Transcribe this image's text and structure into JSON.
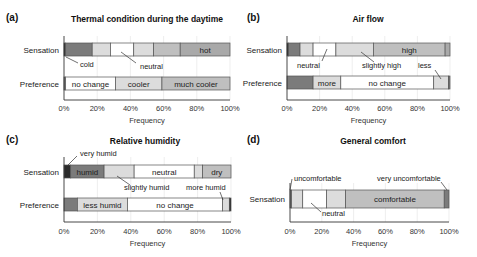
{
  "palette": {
    "black": "#2a2a2a",
    "dark": "#7b7b7b",
    "mid": "#a9a9a9",
    "gray": "#bfbfbf",
    "light": "#dcdcdc",
    "white": "#ffffff",
    "outline": "#555555",
    "grid": "#e6e6e6"
  },
  "chart_data": [
    {
      "panel": "(a)",
      "type": "bar",
      "orientation": "horizontal-stacked",
      "title": "Thermal condition during the daytime",
      "xlabel": "Frequency",
      "xlim": [
        0,
        100
      ],
      "xticks": [
        "0%",
        "20%",
        "40%",
        "60%",
        "80%",
        "100%"
      ],
      "categories": [
        "Sensation",
        "Preference"
      ],
      "rows": [
        {
          "name": "Sensation",
          "segments": [
            {
              "label": "cold",
              "value": 1,
              "color": "black"
            },
            {
              "label": "",
              "value": 16,
              "color": "dark"
            },
            {
              "label": "",
              "value": 11,
              "color": "light"
            },
            {
              "label": "neutral",
              "value": 14,
              "color": "white"
            },
            {
              "label": "",
              "value": 12,
              "color": "light"
            },
            {
              "label": "",
              "value": 16,
              "color": "gray"
            },
            {
              "label": "hot",
              "value": 30,
              "color": "mid"
            }
          ]
        },
        {
          "name": "Preference",
          "segments": [
            {
              "label": "",
              "value": 1,
              "color": "dark"
            },
            {
              "label": "no change",
              "value": 30,
              "color": "white"
            },
            {
              "label": "cooler",
              "value": 28,
              "color": "light"
            },
            {
              "label": "much cooler",
              "value": 41,
              "color": "gray"
            }
          ]
        }
      ],
      "annotations": [
        {
          "text": "cold",
          "row": "Sensation",
          "points_to_pct": 0.5
        },
        {
          "text": "neutral",
          "row": "Sensation",
          "points_to_pct": 35
        }
      ]
    },
    {
      "panel": "(b)",
      "type": "bar",
      "orientation": "horizontal-stacked",
      "title": "Air flow",
      "xlabel": "Frequency",
      "xlim": [
        0,
        100
      ],
      "xticks": [
        "0%",
        "20%",
        "40%",
        "60%",
        "80%",
        "100%"
      ],
      "categories": [
        "Sensation",
        "Preference"
      ],
      "rows": [
        {
          "name": "Sensation",
          "segments": [
            {
              "label": "",
              "value": 1,
              "color": "black"
            },
            {
              "label": "",
              "value": 7,
              "color": "dark"
            },
            {
              "label": "",
              "value": 8,
              "color": "light"
            },
            {
              "label": "neutral",
              "value": 14,
              "color": "white"
            },
            {
              "label": "slightly high",
              "value": 23,
              "color": "light"
            },
            {
              "label": "high",
              "value": 44,
              "color": "gray"
            },
            {
              "label": "",
              "value": 3,
              "color": "mid"
            }
          ]
        },
        {
          "name": "Preference",
          "segments": [
            {
              "label": "",
              "value": 16,
              "color": "dark"
            },
            {
              "label": "more",
              "value": 17,
              "color": "light"
            },
            {
              "label": "no change",
              "value": 57,
              "color": "white"
            },
            {
              "label": "less",
              "value": 9,
              "color": "light"
            },
            {
              "label": "",
              "value": 1,
              "color": "dark"
            }
          ]
        }
      ],
      "annotations": [
        {
          "text": "neutral",
          "row": "Sensation",
          "points_to_pct": 24
        },
        {
          "text": "slightly high",
          "row": "Sensation",
          "points_to_pct": 42
        },
        {
          "text": "less",
          "row": "Preference",
          "points_to_pct": 95
        }
      ]
    },
    {
      "panel": "(c)",
      "type": "bar",
      "orientation": "horizontal-stacked",
      "title": "Relative humidity",
      "xlabel": "Frequency",
      "xlim": [
        0,
        100
      ],
      "xticks": [
        "0%",
        "20%",
        "40%",
        "60%",
        "80%",
        "100%"
      ],
      "categories": [
        "Sensation",
        "Preference"
      ],
      "rows": [
        {
          "name": "Sensation",
          "segments": [
            {
              "label": "very humid",
              "value": 4,
              "color": "black"
            },
            {
              "label": "humid",
              "value": 20,
              "color": "dark"
            },
            {
              "label": "slightly humid",
              "value": 18,
              "color": "light"
            },
            {
              "label": "neutral",
              "value": 36,
              "color": "white"
            },
            {
              "label": "",
              "value": 5,
              "color": "light"
            },
            {
              "label": "dry",
              "value": 17,
              "color": "gray"
            }
          ]
        },
        {
          "name": "Preference",
          "segments": [
            {
              "label": "",
              "value": 8,
              "color": "dark"
            },
            {
              "label": "less humid",
              "value": 30,
              "color": "light"
            },
            {
              "label": "no change",
              "value": 57,
              "color": "white"
            },
            {
              "label": "more humid",
              "value": 4,
              "color": "light"
            },
            {
              "label": "",
              "value": 1,
              "color": "black"
            }
          ]
        }
      ],
      "annotations": [
        {
          "text": "very humid",
          "row": "Sensation",
          "points_to_pct": 3
        },
        {
          "text": "slightly humid",
          "row": "Sensation",
          "points_to_pct": 32
        },
        {
          "text": "more humid",
          "row": "Preference",
          "points_to_pct": 97
        }
      ]
    },
    {
      "panel": "(d)",
      "type": "bar",
      "orientation": "horizontal-stacked",
      "title": "General comfort",
      "xlabel": "Frequency",
      "xlim": [
        0,
        100
      ],
      "xticks": [
        "0%",
        "20%",
        "40%",
        "60%",
        "80%",
        "100%"
      ],
      "categories": [
        "Sensation"
      ],
      "rows": [
        {
          "name": "Sensation",
          "segments": [
            {
              "label": "",
              "value": 1,
              "color": "dark"
            },
            {
              "label": "uncomfortable",
              "value": 7,
              "color": "light"
            },
            {
              "label": "neutral",
              "value": 15,
              "color": "white"
            },
            {
              "label": "",
              "value": 12,
              "color": "light"
            },
            {
              "label": "comfortable",
              "value": 62,
              "color": "gray"
            },
            {
              "label": "very uncomfortable",
              "value": 3,
              "color": "dark"
            }
          ]
        }
      ],
      "annotations": [
        {
          "text": "uncomfortable",
          "row": "Sensation",
          "points_to_pct": 0.5
        },
        {
          "text": "neutral",
          "row": "Sensation",
          "points_to_pct": 14
        },
        {
          "text": "very uncomfortable",
          "row": "Sensation",
          "points_to_pct": 98.5
        }
      ]
    }
  ]
}
